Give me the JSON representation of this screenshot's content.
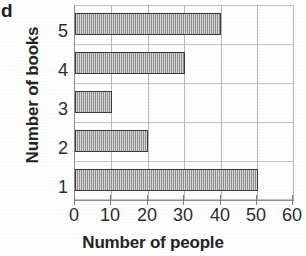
{
  "panel_label": "d",
  "chart_data": {
    "type": "bar",
    "orientation": "horizontal",
    "title": "",
    "xlabel": "Number of people",
    "ylabel": "Number of books",
    "categories": [
      "1",
      "2",
      "3",
      "4",
      "5"
    ],
    "values": [
      50,
      20,
      10,
      30,
      40
    ],
    "bars": [
      {
        "category": "5",
        "value": 40
      },
      {
        "category": "4",
        "value": 30
      },
      {
        "category": "3",
        "value": 10
      },
      {
        "category": "2",
        "value": 20
      },
      {
        "category": "1",
        "value": 50
      }
    ],
    "xlim": [
      0,
      60
    ],
    "xticks": [
      0,
      10,
      20,
      30,
      40,
      50,
      60
    ],
    "xtick_labels": [
      "0",
      "10",
      "20",
      "30",
      "40",
      "50",
      "60"
    ],
    "ytick_labels_top_to_bottom": [
      "5",
      "4",
      "3",
      "2",
      "1"
    ],
    "grid": true,
    "legend": false,
    "bar_fill_color": "#a8a8a8",
    "bar_edge_color": "#3a3a3a",
    "grid_color": "#bfbfbf",
    "axis_color": "#8e8e8e",
    "text_color": "#2d2d2d"
  }
}
